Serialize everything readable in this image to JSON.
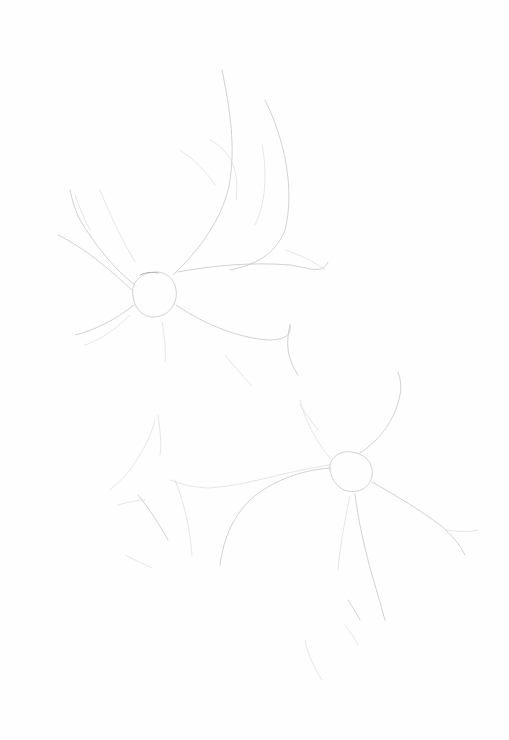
{
  "artwork": {
    "subject": "pencil sketch of two flowers",
    "background_color": "#fefefe",
    "stroke_color": "#c4c4c4",
    "flowers": [
      {
        "name": "upper-flower",
        "center": [
          155,
          295
        ],
        "radius": 22
      },
      {
        "name": "lower-flower",
        "center": [
          352,
          472
        ],
        "radius": 20
      }
    ]
  }
}
